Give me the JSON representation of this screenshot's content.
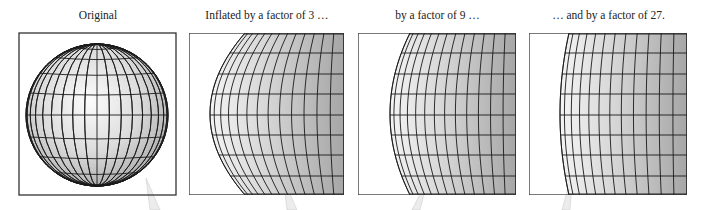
{
  "figure": {
    "panels": [
      {
        "caption": "Original",
        "factor": 1
      },
      {
        "caption": "Inflated by a factor of 3 …",
        "factor": 3
      },
      {
        "caption": "by a factor of 9 …",
        "factor": 9
      },
      {
        "caption": "… and by a factor of 27.",
        "factor": 27
      }
    ],
    "colors": {
      "frame": "#333333",
      "grid": "#1a1a1a",
      "sphere_light": "#fafafa",
      "sphere_dark": "#9a9a9a",
      "callout": "#e6e6e6"
    }
  }
}
